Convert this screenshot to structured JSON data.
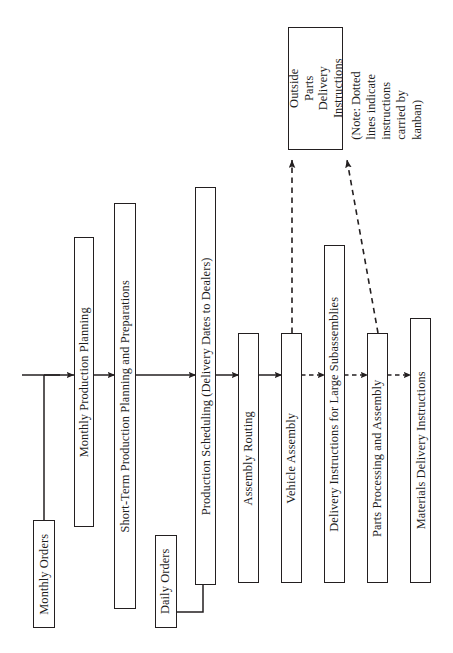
{
  "diagram": {
    "orientation": "rotated-90-ccw",
    "background_color": "#ffffff",
    "line_color": "#231f20",
    "nodes": [
      {
        "id": "monthly_orders",
        "label": "Monthly Orders"
      },
      {
        "id": "monthly_production_planning",
        "label": "Monthly Production Planning"
      },
      {
        "id": "short_term_planning",
        "label": "Short-Term Production Planning and Preparations"
      },
      {
        "id": "daily_orders",
        "label": "Daily Orders"
      },
      {
        "id": "production_scheduling",
        "label": "Production Scheduling (Delivery Dates to Dealers)"
      },
      {
        "id": "assembly_routing",
        "label": "Assembly Routing"
      },
      {
        "id": "vehicle_assembly",
        "label": "Vehicle Assembly"
      },
      {
        "id": "outside_parts_delivery",
        "label": "Outside Parts Delivery Instructions"
      },
      {
        "id": "delivery_instructions_large_subassemblies",
        "label": "Delivery Instructions for Large Subassemblies"
      },
      {
        "id": "parts_processing_assembly",
        "label": "Parts Processing and Assembly"
      },
      {
        "id": "materials_delivery_instructions",
        "label": "Materials Delivery Instructions"
      }
    ],
    "note": "(Note: Dotted lines indicate instructions carried by kanban)",
    "edges": [
      {
        "from": "flow-start",
        "to": "monthly_production_planning",
        "style": "solid"
      },
      {
        "from": "monthly_orders",
        "to": "flow-line",
        "style": "solid"
      },
      {
        "from": "monthly_production_planning",
        "to": "short_term_planning",
        "style": "solid"
      },
      {
        "from": "short_term_planning",
        "to": "production_scheduling",
        "style": "solid"
      },
      {
        "from": "daily_orders",
        "to": "production_scheduling",
        "style": "solid"
      },
      {
        "from": "production_scheduling",
        "to": "assembly_routing",
        "style": "solid"
      },
      {
        "from": "assembly_routing",
        "to": "vehicle_assembly",
        "style": "solid"
      },
      {
        "from": "vehicle_assembly",
        "to": "delivery_instructions_large_subassemblies",
        "style": "dashed"
      },
      {
        "from": "delivery_instructions_large_subassemblies",
        "to": "parts_processing_assembly",
        "style": "dashed"
      },
      {
        "from": "parts_processing_assembly",
        "to": "materials_delivery_instructions",
        "style": "dashed"
      },
      {
        "from": "vehicle_assembly",
        "to": "outside_parts_delivery",
        "style": "dashed"
      },
      {
        "from": "parts_processing_assembly",
        "to": "outside_parts_delivery",
        "style": "dashed"
      }
    ]
  }
}
